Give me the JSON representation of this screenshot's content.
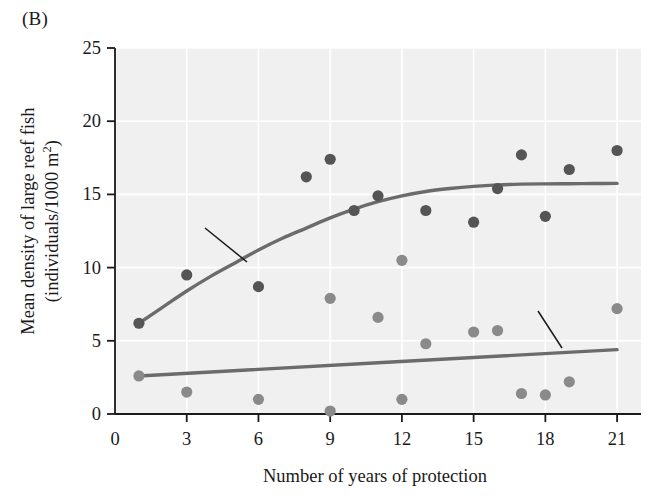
{
  "panel": {
    "label": "(B)"
  },
  "chart_data": {
    "type": "scatter",
    "title": "",
    "xlabel": "Number of years of protection",
    "ylabel_line1": "Mean density of large reef fish",
    "ylabel_line2_prefix": "(individuals/1000 m",
    "ylabel_line2_sup": "2",
    "ylabel_line2_suffix": ")",
    "xlim": [
      0,
      22
    ],
    "ylim": [
      0,
      25
    ],
    "xticks": [
      0,
      3,
      6,
      9,
      12,
      15,
      18,
      21
    ],
    "xticklabels": [
      "0",
      "3",
      "6",
      "9",
      "12",
      "15",
      "18",
      "21"
    ],
    "yticks": [
      0,
      5,
      10,
      15,
      20,
      25
    ],
    "yticklabels": [
      "0",
      "5",
      "10",
      "15",
      "20",
      "25"
    ],
    "grid": true,
    "grid_color": "#ffffff",
    "plot_bg": "#f0f0f0",
    "legend_position": "top-right",
    "series": [
      {
        "name": "Census inside reserve",
        "color": "#555555",
        "marker": "circle",
        "points": [
          [
            1,
            6.2
          ],
          [
            3,
            9.5
          ],
          [
            6,
            8.7
          ],
          [
            8,
            16.2
          ],
          [
            9,
            17.4
          ],
          [
            10,
            13.9
          ],
          [
            11,
            14.9
          ],
          [
            13,
            13.9
          ],
          [
            15,
            13.1
          ],
          [
            16,
            15.4
          ],
          [
            17,
            17.7
          ],
          [
            18,
            13.5
          ],
          [
            19,
            16.7
          ],
          [
            21,
            18.0
          ]
        ],
        "trend": {
          "type": "saturating-curve",
          "color": "#6b6b6b",
          "points": [
            [
              1,
              6.2
            ],
            [
              2,
              7.3
            ],
            [
              3,
              8.4
            ],
            [
              4,
              9.4
            ],
            [
              5,
              10.3
            ],
            [
              6,
              11.2
            ],
            [
              7,
              12.0
            ],
            [
              8,
              12.7
            ],
            [
              9,
              13.4
            ],
            [
              10,
              14.0
            ],
            [
              11,
              14.5
            ],
            [
              12,
              14.9
            ],
            [
              13,
              15.2
            ],
            [
              14,
              15.4
            ],
            [
              15,
              15.55
            ],
            [
              16,
              15.65
            ],
            [
              17,
              15.7
            ],
            [
              18,
              15.72
            ],
            [
              19,
              15.73
            ],
            [
              20,
              15.74
            ],
            [
              21,
              15.75
            ]
          ]
        }
      },
      {
        "name": "Census outside reserve",
        "color": "#8a8a8a",
        "marker": "circle",
        "points": [
          [
            1,
            2.6
          ],
          [
            3,
            1.5
          ],
          [
            6,
            1.0
          ],
          [
            9,
            0.2
          ],
          [
            9,
            7.9
          ],
          [
            11,
            6.6
          ],
          [
            12,
            1.0
          ],
          [
            13,
            4.8
          ],
          [
            15,
            5.6
          ],
          [
            16,
            5.7
          ],
          [
            12,
            10.5
          ],
          [
            17,
            1.4
          ],
          [
            18,
            1.3
          ],
          [
            19,
            2.2
          ],
          [
            21,
            7.2
          ]
        ],
        "trend": {
          "type": "line",
          "color": "#6b6b6b",
          "points": [
            [
              1,
              2.6
            ],
            [
              21,
              4.4
            ]
          ]
        }
      }
    ],
    "annotations": [
      {
        "id": "inside",
        "text_lines": [
          "Fish rapidly",
          "increasing inside",
          "reserve"
        ],
        "leader_from": [
          205,
          228
        ],
        "leader_to": [
          247,
          262
        ]
      },
      {
        "id": "outside",
        "text_lines": [
          "Fish slowly increasing",
          "outside reserve"
        ],
        "leader_from": [
          538,
          311
        ],
        "leader_to": [
          562,
          348
        ]
      }
    ]
  }
}
